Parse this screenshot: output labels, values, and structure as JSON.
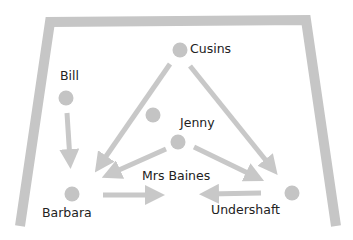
{
  "diagram": {
    "colors": {
      "frame": "#c6c6c6",
      "node": "#c4c4c4",
      "arrow": "#c8c8c8",
      "text": "#222222",
      "background": "#ffffff"
    },
    "nodes": [
      {
        "id": "cusins",
        "label": "Cusins",
        "x": 180,
        "y": 50
      },
      {
        "id": "bill",
        "label": "Bill",
        "x": 66,
        "y": 98
      },
      {
        "id": "unlabeled",
        "label": "",
        "x": 152,
        "y": 114
      },
      {
        "id": "jenny",
        "label": "Jenny",
        "x": 178,
        "y": 142
      },
      {
        "id": "barbara",
        "label": "Barbara",
        "x": 71,
        "y": 193
      },
      {
        "id": "undershaft",
        "label": "Undershaft",
        "x": 292,
        "y": 192
      }
    ],
    "labels": {
      "cusins": "Cusins",
      "bill": "Bill",
      "jenny": "Jenny",
      "mrs_baines": "Mrs Baines",
      "barbara": "Barbara",
      "undershaft": "Undershaft"
    },
    "edges": [
      {
        "from": "cusins",
        "to": "barbara"
      },
      {
        "from": "cusins",
        "to": "undershaft"
      },
      {
        "from": "bill",
        "to": "barbara"
      },
      {
        "from": "jenny",
        "to": "barbara"
      },
      {
        "from": "jenny",
        "to": "undershaft"
      },
      {
        "from": "barbara",
        "to": "mrs_baines"
      },
      {
        "from": "undershaft",
        "to": "mrs_baines"
      }
    ]
  }
}
